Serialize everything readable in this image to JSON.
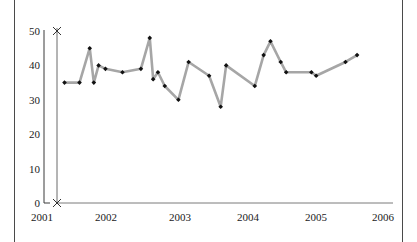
{
  "chart_data": {
    "type": "line",
    "title": "",
    "xlabel": "",
    "ylabel": "",
    "xlim": [
      2001,
      2006
    ],
    "ylim": [
      0,
      50
    ],
    "grid": false,
    "legend": null,
    "xticks": [
      "2001",
      "2002",
      "2003",
      "2004",
      "2005",
      "2006"
    ],
    "xtick_values": [
      2001,
      2002,
      2003,
      2004,
      2005,
      2006
    ],
    "yticks": [
      "0",
      "10",
      "20",
      "30",
      "40",
      "50"
    ],
    "ytick_values": [
      0,
      10,
      20,
      30,
      40,
      50
    ],
    "series": [
      {
        "name": "series-1",
        "line_color": "#a6a6a6",
        "marker_color": "#111111",
        "marker": "diamond",
        "x": [
          2001.33,
          2001.55,
          2001.7,
          2001.76,
          2001.83,
          2001.93,
          2002.18,
          2002.45,
          2002.58,
          2002.63,
          2002.7,
          2002.8,
          2003.0,
          2003.15,
          2003.45,
          2003.62,
          2003.7,
          2004.12,
          2004.25,
          2004.35,
          2004.5,
          2004.58,
          2004.95,
          2005.02,
          2005.45,
          2005.62
        ],
        "values": [
          35,
          35,
          45,
          35,
          40,
          39,
          38,
          39,
          48,
          36,
          38,
          34,
          30,
          41,
          37,
          28,
          40,
          34,
          43,
          47,
          41,
          38,
          38,
          37,
          41,
          43
        ]
      }
    ]
  },
  "axes": {
    "y_axis_arrow": true,
    "x_axis_arrow": false,
    "origin_marker": "x-marker",
    "top_marker": "x-marker"
  }
}
